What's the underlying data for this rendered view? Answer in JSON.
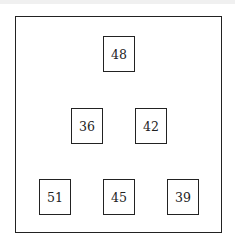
{
  "diagram": {
    "type": "number-pyramid",
    "rows": [
      {
        "row": 1,
        "cells": [
          {
            "value": "48",
            "x": 103,
            "y": 36
          }
        ]
      },
      {
        "row": 2,
        "cells": [
          {
            "value": "36",
            "x": 71,
            "y": 108
          },
          {
            "value": "42",
            "x": 135,
            "y": 108
          }
        ]
      },
      {
        "row": 3,
        "cells": [
          {
            "value": "51",
            "x": 39,
            "y": 179
          },
          {
            "value": "45",
            "x": 103,
            "y": 179
          },
          {
            "value": "39",
            "x": 167,
            "y": 179
          }
        ]
      }
    ],
    "colors": {
      "border": "#222222",
      "background": "#ffffff",
      "text": "#222222"
    }
  }
}
